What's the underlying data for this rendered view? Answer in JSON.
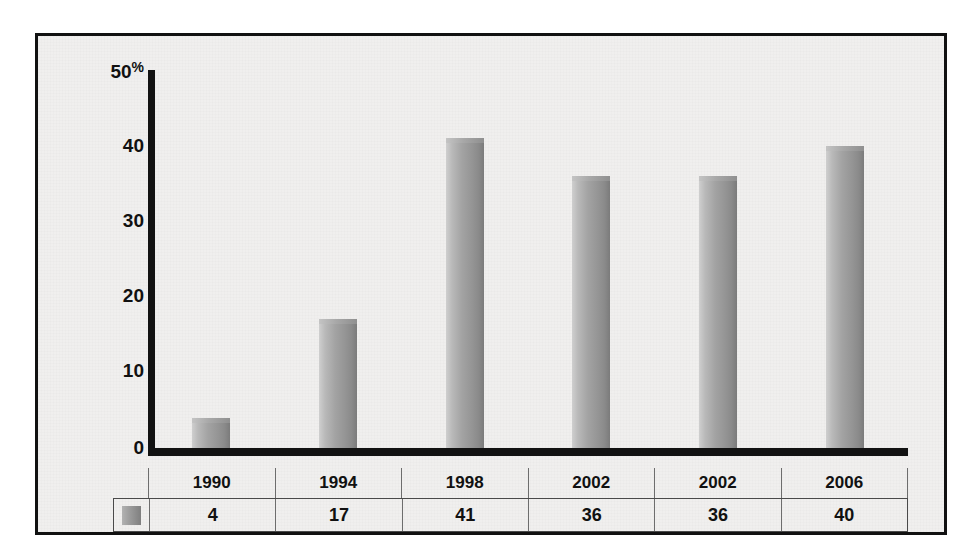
{
  "chart_data": {
    "type": "bar",
    "title": "",
    "xlabel": "",
    "ylabel": "%",
    "categories": [
      "1990",
      "1994",
      "1998",
      "2002",
      "2002",
      "2006"
    ],
    "values": [
      4,
      17,
      41,
      36,
      36,
      40
    ],
    "series": [
      {
        "name": "",
        "values": [
          4,
          17,
          41,
          36,
          36,
          40
        ]
      }
    ],
    "ylim": [
      0,
      50
    ],
    "y_ticks": [
      "0",
      "10",
      "20",
      "30",
      "40",
      "50"
    ],
    "y_unit": "%",
    "grid": false,
    "legend": "swatch-only",
    "bar_color": "#9a9a9a",
    "background_color": "#f0efee",
    "axis_color": "#121212"
  },
  "axis": {
    "unit_symbol": "%",
    "ticks": [
      {
        "label": "50"
      },
      {
        "label": "40"
      },
      {
        "label": "30"
      },
      {
        "label": "20"
      },
      {
        "label": "10"
      },
      {
        "label": "0"
      }
    ]
  },
  "table": {
    "headers": [
      "1990",
      "1994",
      "1998",
      "2002",
      "2002",
      "2006"
    ],
    "values": [
      "4",
      "17",
      "41",
      "36",
      "36",
      "40"
    ],
    "legend_swatch": "series-color-swatch"
  }
}
